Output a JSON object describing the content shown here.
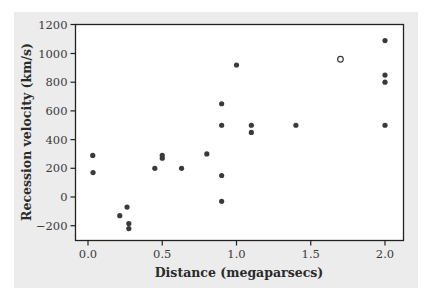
{
  "chart_data": {
    "type": "scatter",
    "title": "",
    "xlabel": "Distance (megaparsecs)",
    "ylabel": "Recession velocity (km/s)",
    "xlim": [
      -0.03,
      2.12
    ],
    "ylim": [
      -300,
      1200
    ],
    "x_ticks": [
      0.0,
      0.5,
      1.0,
      1.5,
      2.0
    ],
    "x_tick_labels": [
      "0.0",
      "0.5",
      "1.0",
      "1.5",
      "2.0"
    ],
    "y_ticks": [
      -200,
      0,
      200,
      400,
      600,
      800,
      1000,
      1200
    ],
    "y_tick_labels": [
      "−200",
      "0",
      "200",
      "400",
      "600",
      "800",
      "1000",
      "1200"
    ],
    "grid": false,
    "legend": null,
    "series": [
      {
        "name": "galaxies",
        "marker": "filled-circle",
        "color": "#3a3a3a",
        "points": [
          {
            "x": 0.032,
            "y": 290
          },
          {
            "x": 0.034,
            "y": 170
          },
          {
            "x": 0.214,
            "y": -130
          },
          {
            "x": 0.263,
            "y": -70
          },
          {
            "x": 0.275,
            "y": -185
          },
          {
            "x": 0.275,
            "y": -220
          },
          {
            "x": 0.45,
            "y": 200
          },
          {
            "x": 0.5,
            "y": 290
          },
          {
            "x": 0.5,
            "y": 270
          },
          {
            "x": 0.63,
            "y": 200
          },
          {
            "x": 0.8,
            "y": 300
          },
          {
            "x": 0.9,
            "y": -30
          },
          {
            "x": 0.9,
            "y": 650
          },
          {
            "x": 0.9,
            "y": 150
          },
          {
            "x": 0.9,
            "y": 500
          },
          {
            "x": 1.0,
            "y": 920
          },
          {
            "x": 1.1,
            "y": 450
          },
          {
            "x": 1.1,
            "y": 500
          },
          {
            "x": 1.4,
            "y": 500
          },
          {
            "x": 1.7,
            "y": 960
          },
          {
            "x": 2.0,
            "y": 500
          },
          {
            "x": 2.0,
            "y": 850
          },
          {
            "x": 2.0,
            "y": 800
          },
          {
            "x": 2.0,
            "y": 1090
          }
        ]
      },
      {
        "name": "highlighted point",
        "marker": "open-circle",
        "color": "#3a3a3a",
        "points": [
          {
            "x": 1.7,
            "y": 960
          }
        ]
      }
    ]
  },
  "colors": {
    "panel_background": "#ececec",
    "plot_background": "#ffffff",
    "axis": "#222222",
    "marker": "#3a3a3a"
  }
}
